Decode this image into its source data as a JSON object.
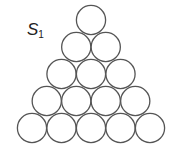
{
  "figure": {
    "label": "S",
    "label_subscript": "1",
    "shape": "triangular arrangement of circles",
    "rows": [
      1,
      2,
      3,
      4,
      5
    ],
    "total_circles": 15,
    "stroke_color": "#555555",
    "fill_color": "#ffffff"
  }
}
